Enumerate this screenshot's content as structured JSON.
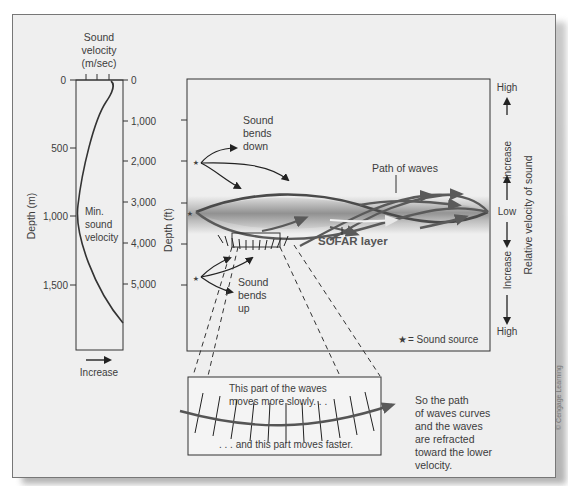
{
  "velocity_profile": {
    "title_line1": "Sound",
    "title_line2": "velocity",
    "title_line3": "(m/sec)",
    "left_axis_label": "Depth (m)",
    "left_ticks": [
      "0",
      "500",
      "1,000",
      "1,500"
    ],
    "right_ticks": [
      "0",
      "1,000",
      "2,000",
      "3,000",
      "4,000",
      "5,000"
    ],
    "min_label_line1": "Min.",
    "min_label_line2": "sound",
    "min_label_line3": "velocity",
    "x_arrow_label": "Increase"
  },
  "main_panel": {
    "depth_axis_label": "Depth (ft)",
    "bends_down_line1": "Sound",
    "bends_down_line2": "bends",
    "bends_down_line3": "down",
    "bends_up_line1": "Sound",
    "bends_up_line2": "bends",
    "bends_up_line3": "up",
    "path_label": "Path of waves",
    "sofar_label": "SOFAR layer",
    "legend_symbol": "★",
    "legend_text": "= Sound source"
  },
  "velocity_scale": {
    "top": "High",
    "upper_increase": "Increase",
    "middle": "Low",
    "lower_increase": "Increase",
    "bottom": "High",
    "axis_label": "Relative velocity of sound"
  },
  "detail_box": {
    "slow_line1": "This part of the waves",
    "slow_line2": "moves more slowly. . .",
    "fast_line": ". . . and this part moves faster."
  },
  "explanation": {
    "line1": "So the path",
    "line2": "of waves curves",
    "line3": "and the waves",
    "line4": "are refracted",
    "line5": "toward the lower",
    "line6": "velocity."
  },
  "credit": "© Cengage Learning",
  "colors": {
    "panel_bg": "#efefef",
    "wave_path": "#555555",
    "sofar_band": "#a8a8a8",
    "line": "#333333"
  }
}
